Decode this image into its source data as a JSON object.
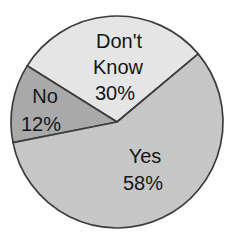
{
  "chart_data": {
    "type": "pie",
    "title": "",
    "labels": [
      "Don't Know",
      "No",
      "Yes"
    ],
    "values": [
      30,
      12,
      58
    ],
    "value_unit": "%",
    "legend_position": "none",
    "labels_inside_slices": true,
    "stroke_color": "#3c3c3c",
    "stroke_width": 1.7,
    "text_color": "#151515",
    "font_size": 20,
    "geometry": {
      "cx": 117,
      "cy": 122,
      "r": 106,
      "start_angle_deg": 40,
      "direction": "ccw"
    },
    "slices": [
      {
        "id": "dont-know",
        "label": "Don't Know",
        "value": 30,
        "display_value": "30%",
        "color": "#e8e8e8",
        "lines": [
          {
            "text": "Don't",
            "x": 119,
            "y": 48
          },
          {
            "text": "Know",
            "x": 118,
            "y": 74
          },
          {
            "text": "30%",
            "x": 115,
            "y": 100
          }
        ]
      },
      {
        "id": "no",
        "label": "No",
        "value": 12,
        "display_value": "12%",
        "color": "#ababab",
        "lines": [
          {
            "text": "No",
            "x": 45,
            "y": 103
          },
          {
            "text": "12%",
            "x": 41,
            "y": 131
          }
        ]
      },
      {
        "id": "yes",
        "label": "Yes",
        "value": 58,
        "display_value": "58%",
        "color": "#c9c9c9",
        "lines": [
          {
            "text": "Yes",
            "x": 145,
            "y": 163
          },
          {
            "text": "58%",
            "x": 143,
            "y": 190
          }
        ]
      }
    ]
  }
}
